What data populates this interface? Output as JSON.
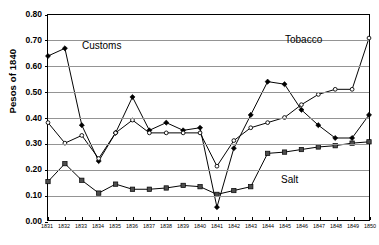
{
  "chart_data": {
    "type": "line",
    "title": "",
    "xlabel": "",
    "ylabel": "Pesos of 1840",
    "xlim": [
      1831,
      1850
    ],
    "ylim": [
      0.0,
      0.8
    ],
    "ytick_step": 0.1,
    "grid": true,
    "legend_position": "inline-annotations",
    "x": [
      1831,
      1832,
      1833,
      1834,
      1835,
      1836,
      1837,
      1838,
      1839,
      1840,
      1841,
      1842,
      1843,
      1844,
      1845,
      1846,
      1847,
      1848,
      1849,
      1850
    ],
    "categories": [
      "1831",
      "1832",
      "1833",
      "1834",
      "1835",
      "1836",
      "1837",
      "1838",
      "1839",
      "1840",
      "1841",
      "1842",
      "1843",
      "1844",
      "1845",
      "1846",
      "1847",
      "1848",
      "1849",
      "1850"
    ],
    "yticks": [
      "0.00",
      "0.10",
      "0.20",
      "0.30",
      "0.40",
      "0.50",
      "0.60",
      "0.70",
      "0.80"
    ],
    "series": [
      {
        "name": "Customs",
        "marker": "filled-diamond",
        "values": [
          0.64,
          0.67,
          0.37,
          0.23,
          0.34,
          0.48,
          0.35,
          0.38,
          0.35,
          0.36,
          0.05,
          0.28,
          0.41,
          0.54,
          0.53,
          0.43,
          0.37,
          0.32,
          0.32,
          0.41
        ]
      },
      {
        "name": "Tobacco",
        "marker": "open-circle",
        "values": [
          0.38,
          0.3,
          0.33,
          0.24,
          0.34,
          0.39,
          0.34,
          0.34,
          0.34,
          0.34,
          0.21,
          0.31,
          0.36,
          0.38,
          0.4,
          0.45,
          0.49,
          0.51,
          0.51,
          0.71
        ]
      },
      {
        "name": "Salt",
        "marker": "filled-square",
        "values": [
          0.15,
          0.22,
          0.155,
          0.105,
          0.14,
          0.12,
          0.12,
          0.125,
          0.135,
          0.13,
          0.1,
          0.115,
          0.13,
          0.26,
          0.265,
          0.275,
          0.285,
          0.29,
          0.3,
          0.305
        ]
      }
    ],
    "annotations": [
      {
        "text": "Customs",
        "series": "Customs"
      },
      {
        "text": "Tobacco",
        "series": "Tobacco"
      },
      {
        "text": "Salt",
        "series": "Salt"
      }
    ]
  }
}
